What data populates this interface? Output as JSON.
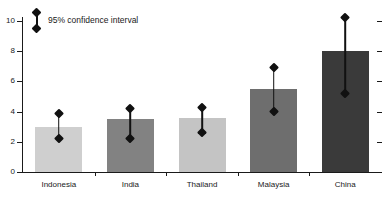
{
  "chart_data": {
    "type": "bar",
    "title": "",
    "xlabel": "",
    "ylabel": "",
    "ylim": [
      0,
      10.8
    ],
    "grid": false,
    "categories": [
      "Indonesia",
      "India",
      "Thailand",
      "Malaysia",
      "China"
    ],
    "values": [
      3.0,
      3.5,
      3.6,
      5.5,
      8.0
    ],
    "error_low": [
      2.2,
      2.2,
      2.6,
      4.0,
      5.2
    ],
    "error_high": [
      3.9,
      4.2,
      4.3,
      6.9,
      10.2
    ],
    "bar_colors": [
      "#cfcfcf",
      "#828282",
      "#c4c4c4",
      "#6e6e6e",
      "#3a3a3a"
    ],
    "y_ticks": [
      0,
      2,
      4,
      6,
      8,
      10
    ],
    "y_tick_labels": [
      "0",
      "2",
      "4",
      "6",
      "8",
      "10"
    ],
    "right_axis_ticks": [
      0,
      2,
      4,
      6,
      8,
      10
    ],
    "right_axis_tick_labels": [
      "",
      "",
      "",
      "",
      "",
      ""
    ],
    "legend": {
      "position": "top-left",
      "entries": [
        {
          "label": "95% confidence interval",
          "marker": "error-bar-diamond"
        }
      ]
    },
    "series": [
      {
        "name": "estimate",
        "values": [
          3.0,
          3.5,
          3.6,
          5.5,
          8.0
        ]
      }
    ]
  },
  "colors": {
    "axis": "#1a1a1a",
    "marker": "#111111",
    "background": "#ffffff"
  }
}
